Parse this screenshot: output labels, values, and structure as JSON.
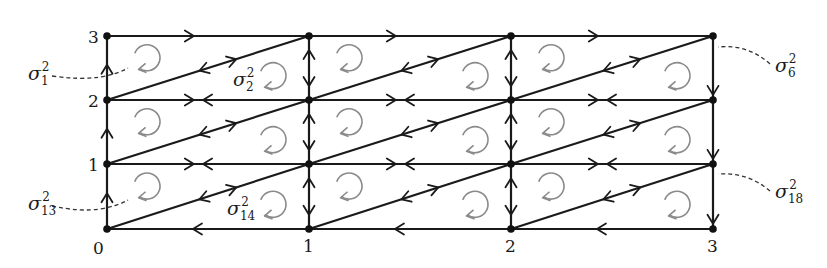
{
  "diagram": {
    "type": "triangulated grid with oriented edges",
    "x_labels": [
      "0",
      "1",
      "2",
      "3"
    ],
    "y_labels": [
      "0",
      "1",
      "2",
      "3"
    ],
    "node_x": [
      107,
      309,
      511,
      713
    ],
    "node_y": [
      229,
      164,
      100,
      36
    ],
    "colors": {
      "edge": "#1a1a1a",
      "rotation_arrow": "#8a8a8a",
      "dashed_leader": "#333333"
    },
    "annotations": [
      {
        "id": "sigma-1",
        "base": "σ",
        "sub": "1",
        "sup": "2"
      },
      {
        "id": "sigma-2",
        "base": "σ",
        "sub": "2",
        "sup": "2"
      },
      {
        "id": "sigma-6",
        "base": "σ",
        "sub": "6",
        "sup": "2"
      },
      {
        "id": "sigma-13",
        "base": "σ",
        "sub": "13",
        "sup": "2"
      },
      {
        "id": "sigma-14",
        "base": "σ",
        "sub": "14",
        "sup": "2"
      },
      {
        "id": "sigma-18",
        "base": "σ",
        "sub": "18",
        "sup": "2"
      }
    ],
    "icons": {
      "rotation": "clockwise-circular-arrow-icon",
      "edge_arrow": "chevron-arrowhead-icon"
    }
  }
}
